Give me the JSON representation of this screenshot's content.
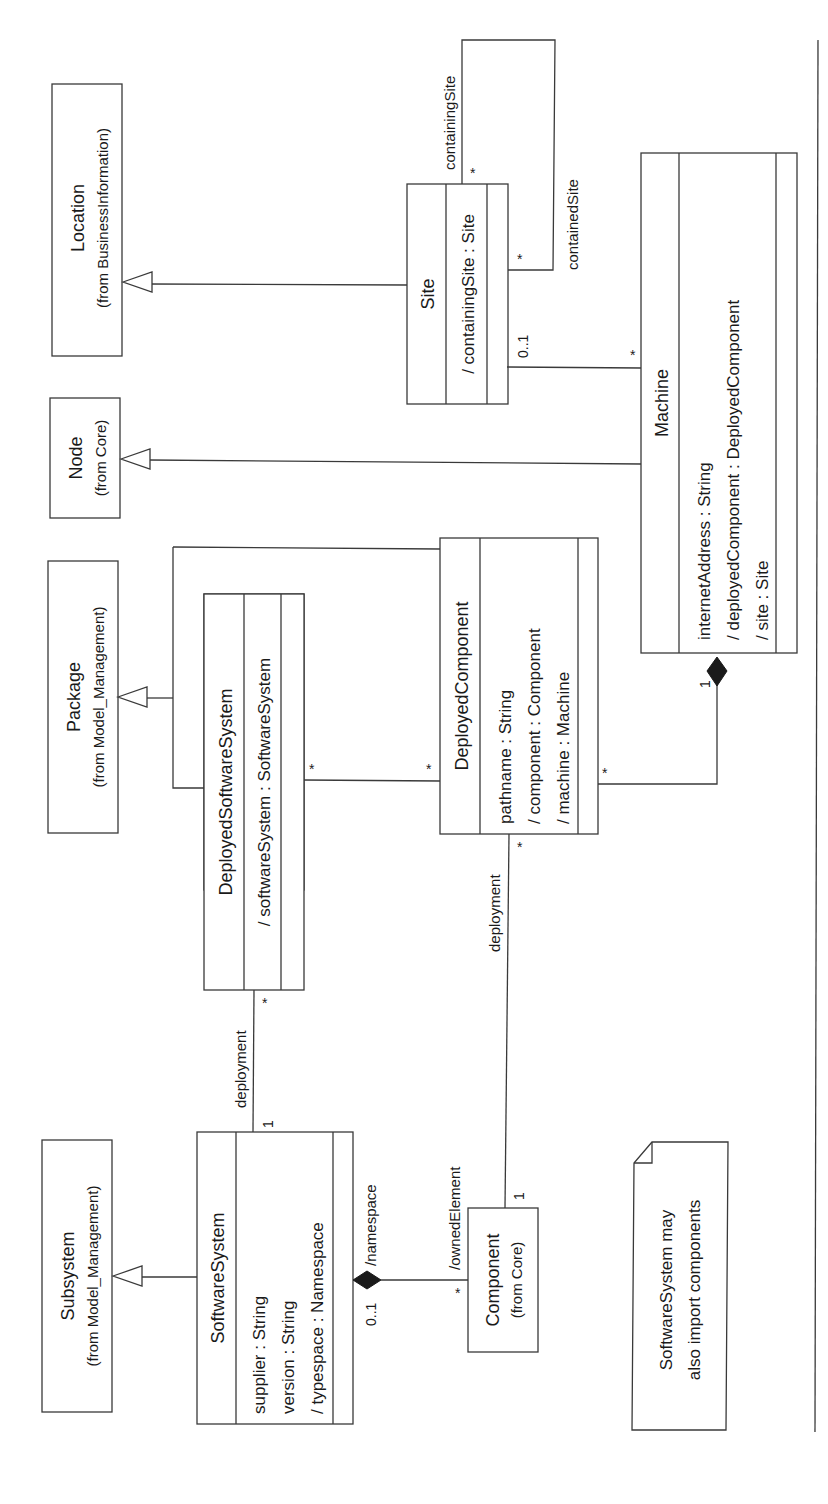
{
  "diagram": {
    "type": "UML class diagram",
    "orientation": "rotated 90 degrees counter-clockwise",
    "classes": {
      "location": {
        "name": "Location",
        "from": "(from BusinessInformation)"
      },
      "node": {
        "name": "Node",
        "from": "(from Core)"
      },
      "package": {
        "name": "Package",
        "from": "(from Model_Management)"
      },
      "subsystem": {
        "name": "Subsystem",
        "from": "(from Model_Management)"
      },
      "component": {
        "name": "Component",
        "from": "(from Core)"
      },
      "site": {
        "name": "Site",
        "attributes": [
          "/ containingSite : Site"
        ]
      },
      "machine": {
        "name": "Machine",
        "attributes": [
          "internetAddress : String",
          "/ deployedComponent : DeployedComponent",
          "/ site : Site"
        ]
      },
      "deployed_component": {
        "name": "DeployedComponent",
        "attributes": [
          "pathname : String",
          "/ component : Component",
          "/ machine : Machine"
        ]
      },
      "deployed_software_system": {
        "name": "DeployedSoftwareSystem",
        "attributes": [
          "/ softwareSystem : SoftwareSystem"
        ]
      },
      "software_system": {
        "name": "SoftwareSystem",
        "attributes": [
          "supplier : String",
          "version : String",
          "/ typespace : Namespace"
        ]
      }
    },
    "associations": {
      "site_self_containing_role": "containingSite",
      "site_self_containing_mult": "*",
      "site_self_contained_role": "containedSite",
      "site_self_contained_mult": "*",
      "site_machine_site_mult": "0..1",
      "site_machine_machine_mult": "*",
      "machine_dc_machine_mult": "1",
      "machine_dc_dc_mult": "*",
      "dss_dc_dss_mult": "*",
      "dss_dc_dc_mult": "*",
      "ss_dss_role": "deployment",
      "ss_dss_ss_mult": "1",
      "ss_dss_dss_mult": "*",
      "comp_dc_role": "deployment",
      "comp_dc_comp_mult": "1",
      "comp_dc_dc_mult": "*",
      "ss_comp_namespace_role": "/namespace",
      "ss_comp_namespace_mult": "0..1",
      "ss_comp_owned_role": "/ownedElement",
      "ss_comp_owned_mult": "*"
    },
    "note": {
      "lines": [
        "SoftwareSystem may",
        "also import components"
      ]
    }
  }
}
